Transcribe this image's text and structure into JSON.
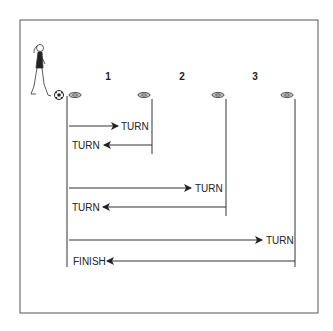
{
  "diagram": {
    "title": "",
    "type": "shuttle-run drill",
    "colors": {
      "line": "#333333",
      "background": "#ffffff",
      "border": "#555555"
    },
    "stations": [
      {
        "label": "1"
      },
      {
        "label": "2"
      },
      {
        "label": "3"
      }
    ],
    "legs": [
      {
        "direction": "out",
        "label": "TURN"
      },
      {
        "direction": "back",
        "label": "TURN"
      },
      {
        "direction": "out",
        "label": "TURN"
      },
      {
        "direction": "back",
        "label": "TURN"
      },
      {
        "direction": "out",
        "label": "TURN"
      },
      {
        "direction": "back",
        "label": "FINISH"
      }
    ],
    "icons": [
      "player-figure-icon",
      "soccer-ball-icon",
      "cone-icon"
    ]
  }
}
